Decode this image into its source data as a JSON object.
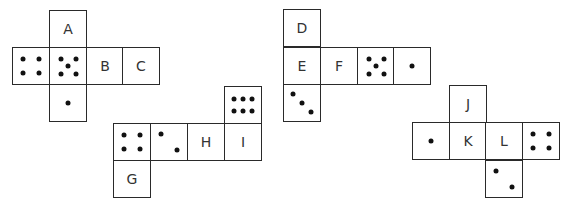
{
  "diagram": {
    "type": "dice-nets",
    "cell_size": 37,
    "nets": [
      {
        "id": "net-1",
        "faces": [
          {
            "x": 49,
            "y": 10,
            "label": "A",
            "pips": 0
          },
          {
            "x": 12,
            "y": 47,
            "label": "",
            "pips": 4
          },
          {
            "x": 49,
            "y": 47,
            "label": "",
            "pips": 5
          },
          {
            "x": 86,
            "y": 47,
            "label": "B",
            "pips": 0
          },
          {
            "x": 122,
            "y": 47,
            "label": "C",
            "pips": 0
          },
          {
            "x": 49,
            "y": 84,
            "label": "",
            "pips": 1
          }
        ]
      },
      {
        "id": "net-2",
        "faces": [
          {
            "x": 224,
            "y": 86,
            "label": "",
            "pips": 6
          },
          {
            "x": 113,
            "y": 123,
            "label": "",
            "pips": 4
          },
          {
            "x": 150,
            "y": 123,
            "label": "",
            "pips": 2
          },
          {
            "x": 187,
            "y": 123,
            "label": "H",
            "pips": 0
          },
          {
            "x": 224,
            "y": 123,
            "label": "I",
            "pips": 0
          },
          {
            "x": 113,
            "y": 160,
            "label": "G",
            "pips": 0
          }
        ]
      },
      {
        "id": "net-3",
        "faces": [
          {
            "x": 283,
            "y": 9,
            "label": "D",
            "pips": 0
          },
          {
            "x": 283,
            "y": 47,
            "label": "E",
            "pips": 0
          },
          {
            "x": 320,
            "y": 47,
            "label": "F",
            "pips": 0
          },
          {
            "x": 357,
            "y": 47,
            "label": "",
            "pips": 5
          },
          {
            "x": 393,
            "y": 47,
            "label": "",
            "pips": 1
          },
          {
            "x": 283,
            "y": 84,
            "label": "",
            "pips": 3
          }
        ]
      },
      {
        "id": "net-4",
        "faces": [
          {
            "x": 449,
            "y": 85,
            "label": "J",
            "pips": 0
          },
          {
            "x": 412,
            "y": 122,
            "label": "",
            "pips": 1
          },
          {
            "x": 449,
            "y": 122,
            "label": "K",
            "pips": 0
          },
          {
            "x": 485,
            "y": 122,
            "label": "L",
            "pips": 0
          },
          {
            "x": 522,
            "y": 122,
            "label": "",
            "pips": 4
          },
          {
            "x": 485,
            "y": 160,
            "label": "",
            "pips": 2
          }
        ]
      }
    ],
    "pip_layouts": {
      "1": [
        [
          0.5,
          0.5
        ]
      ],
      "2": [
        [
          0.27,
          0.27
        ],
        [
          0.73,
          0.73
        ]
      ],
      "3": [
        [
          0.25,
          0.25
        ],
        [
          0.5,
          0.5
        ],
        [
          0.75,
          0.75
        ]
      ],
      "4": [
        [
          0.28,
          0.3
        ],
        [
          0.72,
          0.3
        ],
        [
          0.28,
          0.7
        ],
        [
          0.72,
          0.7
        ]
      ],
      "5": [
        [
          0.3,
          0.3
        ],
        [
          0.72,
          0.3
        ],
        [
          0.5,
          0.5
        ],
        [
          0.3,
          0.72
        ],
        [
          0.72,
          0.72
        ]
      ],
      "6": [
        [
          0.25,
          0.32
        ],
        [
          0.5,
          0.32
        ],
        [
          0.75,
          0.32
        ],
        [
          0.25,
          0.68
        ],
        [
          0.5,
          0.68
        ],
        [
          0.75,
          0.68
        ]
      ]
    }
  }
}
